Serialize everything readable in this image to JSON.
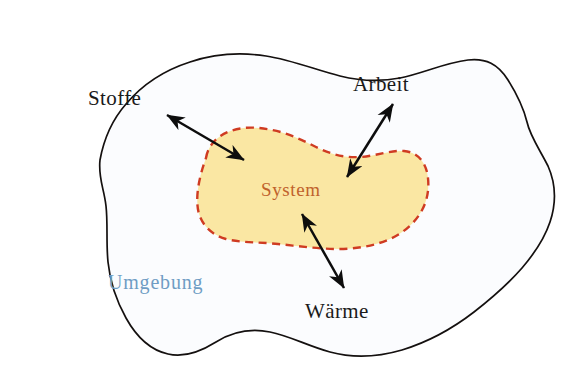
{
  "diagram": {
    "type": "concept-diagram",
    "language": "de",
    "colors": {
      "background": "#ffffff",
      "surroundings_fill": "#fbfcfe",
      "surroundings_stroke": "#14100f",
      "system_fill": "#fae7a3",
      "system_stroke": "#cf3b22",
      "system_label": "#c0622c",
      "surroundings_label": "#6f9cc4",
      "arrow": "#0d0d0d",
      "outer_label": "#1a1a1a"
    },
    "regions": [
      {
        "name": "surroundings",
        "label": "Umgebung",
        "label_x": 108,
        "label_y": 289,
        "border_style": "solid",
        "fill": "#fbfcfe"
      },
      {
        "name": "system",
        "label": "System",
        "label_x": 261,
        "label_y": 196,
        "border_style": "dashed",
        "fill": "#fae7a3"
      }
    ],
    "exchanges": [
      {
        "name": "matter",
        "label": "Stoffe",
        "label_x": 88,
        "label_y": 105,
        "arrow_kind": "double-headed",
        "arrow_from_x": 167,
        "arrow_from_y": 115,
        "arrow_to_x": 244,
        "arrow_to_y": 160
      },
      {
        "name": "work",
        "label": "Arbeit",
        "label_x": 353,
        "label_y": 91,
        "arrow_kind": "double-headed",
        "arrow_from_x": 347,
        "arrow_from_y": 177,
        "arrow_to_x": 393,
        "arrow_to_y": 104
      },
      {
        "name": "heat",
        "label": "Wärme",
        "label_x": 305,
        "label_y": 318,
        "arrow_kind": "double-headed",
        "arrow_from_x": 302,
        "arrow_from_y": 214,
        "arrow_to_x": 344,
        "arrow_to_y": 288
      }
    ],
    "paths": {
      "surroundings_outline": "M 100 160 C 104 138 112 120 126 104 C 142 85 165 70 190 62 C 214 54 240 52 266 56 C 292 60 316 70 340 76 C 360 81 380 82 400 78 C 424 73 444 63 468 60 C 486 58 498 64 508 80 C 518 96 524 110 527 122 C 530 136 540 150 548 166 C 556 184 556 204 550 222 C 544 240 534 254 522 268 C 508 284 492 298 474 312 C 452 329 428 342 402 350 C 378 357 352 358 330 352 C 308 346 290 336 270 332 C 250 328 232 332 216 342 C 200 352 184 358 168 354 C 150 350 136 336 126 318 C 116 300 110 282 108 262 C 106 242 108 224 106 206 C 104 188 98 178 100 160 Z",
      "system_outline": "M 206 158 C 208 146 216 137 228 132 C 242 126 258 127 272 130 C 288 133 302 140 316 147 C 330 154 344 158 360 157 C 376 156 390 150 404 151 C 416 152 424 160 427 172 C 430 186 428 200 421 212 C 414 224 403 233 390 239 C 374 246 356 249 338 249 C 318 249 298 246 278 244 C 260 242 242 243 226 239 C 212 235 203 226 199 214 C 195 200 198 180 206 158 Z"
    }
  }
}
